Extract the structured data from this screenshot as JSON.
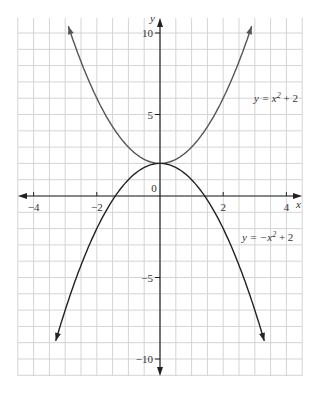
{
  "chart_data": {
    "type": "line",
    "title": "",
    "xlabel": "x",
    "ylabel": "y",
    "xlim": [
      -4.5,
      4.5
    ],
    "ylim": [
      -11,
      11
    ],
    "grid": true,
    "x_ticks": [
      "-4",
      "-2",
      "0",
      "2",
      "4"
    ],
    "y_ticks": [
      "10",
      "5",
      "-5",
      "-10"
    ],
    "series": [
      {
        "name": "y = x² + 2",
        "formula": "x^2+2",
        "domain": [
          -2.9,
          2.9
        ],
        "color": "#555555"
      },
      {
        "name": "y = −x² + 2",
        "formula": "-x^2+2",
        "domain": [
          -3.3,
          3.3
        ],
        "color": "#222222"
      }
    ],
    "annotations": [
      {
        "text": "y = x² + 2",
        "x": 3.2,
        "y": 5.5
      },
      {
        "text": "y = −x² + 2",
        "x": 3.2,
        "y": -1.8
      }
    ]
  }
}
